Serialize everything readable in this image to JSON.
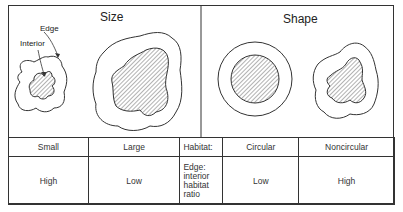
{
  "panels": {
    "size": {
      "title": "Size"
    },
    "shape": {
      "title": "Shape"
    }
  },
  "annotations": {
    "edge": "Edge",
    "interior": "Interior"
  },
  "figures": [
    {
      "id": "small-patch",
      "panel": "size",
      "shape": "irregular",
      "relative_size": "small"
    },
    {
      "id": "large-patch",
      "panel": "size",
      "shape": "irregular",
      "relative_size": "large"
    },
    {
      "id": "circular-patch",
      "panel": "shape",
      "shape": "circular"
    },
    {
      "id": "noncircular-patch",
      "panel": "shape",
      "shape": "irregular"
    }
  ],
  "table": {
    "header": [
      "Small",
      "Large",
      "Habitat:",
      "Circular",
      "Noncircular"
    ],
    "row": {
      "small": "High",
      "large": "Low",
      "row_label_lines": [
        "Edge:",
        "interior",
        "habitat",
        "ratio"
      ],
      "circular": "Low",
      "noncircular": "High"
    }
  },
  "colors": {
    "line": "#333333",
    "hatch": "#555555",
    "background": "#ffffff"
  }
}
